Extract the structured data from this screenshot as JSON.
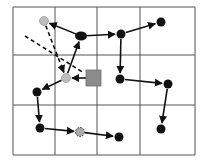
{
  "diagram": {
    "type": "grid-path-graph",
    "grid": {
      "cols": [
        13,
        55,
        97,
        140,
        195
      ],
      "rows": [
        7,
        55,
        105,
        155
      ],
      "line_color": "#555555"
    },
    "colors": {
      "node": "#111111",
      "gray_node": "#bdbdbd",
      "square": "#8c8c8c",
      "edge": "#111111"
    },
    "nodes": [
      {
        "id": "g1",
        "x": 44,
        "y": 21,
        "kind": "gray"
      },
      {
        "id": "n1",
        "x": 81,
        "y": 36,
        "kind": "black-oval"
      },
      {
        "id": "n2",
        "x": 121,
        "y": 34,
        "kind": "black"
      },
      {
        "id": "n3",
        "x": 161,
        "y": 22,
        "kind": "black"
      },
      {
        "id": "g2",
        "x": 66,
        "y": 78,
        "kind": "gray"
      },
      {
        "id": "sq",
        "x": 94,
        "y": 78,
        "kind": "square"
      },
      {
        "id": "n4",
        "x": 120,
        "y": 79,
        "kind": "black"
      },
      {
        "id": "n5",
        "x": 168,
        "y": 84,
        "kind": "black"
      },
      {
        "id": "n6",
        "x": 37,
        "y": 92,
        "kind": "black"
      },
      {
        "id": "n7",
        "x": 40,
        "y": 128,
        "kind": "black"
      },
      {
        "id": "d1",
        "x": 80,
        "y": 132,
        "kind": "dotted"
      },
      {
        "id": "n8",
        "x": 119,
        "y": 137,
        "kind": "black"
      },
      {
        "id": "n9",
        "x": 161,
        "y": 129,
        "kind": "black"
      }
    ],
    "edges": [
      {
        "from": "n1",
        "to": "g1",
        "style": "solid"
      },
      {
        "from": "n1",
        "to": "n2",
        "style": "solid"
      },
      {
        "from": "n2",
        "to": "n3",
        "style": "solid"
      },
      {
        "from": "n2",
        "to": "n4",
        "style": "solid"
      },
      {
        "from": "n4",
        "to": "n5",
        "style": "solid"
      },
      {
        "from": "n5",
        "to": "n9",
        "style": "solid"
      },
      {
        "from": "g2",
        "to": "n1",
        "style": "solid"
      },
      {
        "from": "sq",
        "to": "g2",
        "style": "solid"
      },
      {
        "from": "g2",
        "to": "n6",
        "style": "solid"
      },
      {
        "from": "n6",
        "to": "n7",
        "style": "solid"
      },
      {
        "from": "n7",
        "to": "d1",
        "style": "solid"
      },
      {
        "from": "d1",
        "to": "n8",
        "style": "solid"
      },
      {
        "from": "g1",
        "to": "g2",
        "style": "dashed"
      }
    ],
    "dashed_lines": [
      {
        "x1": 25,
        "y1": 36,
        "x2": 84,
        "y2": 73
      }
    ]
  }
}
